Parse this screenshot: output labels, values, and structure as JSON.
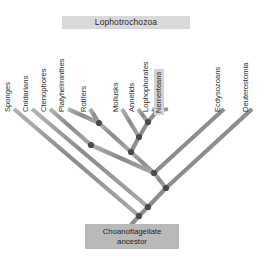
{
  "figure": {
    "title_banner": {
      "label": "Lophotrochozoa",
      "background": "#d9d9d9"
    },
    "root": {
      "line1": "Choanoflagellate",
      "line2": "ancestor",
      "background": "#b9b9b9"
    },
    "colors": {
      "branch": "#8f8f8f",
      "branch_shadow": "#c8c8c8",
      "node": "#4a4a4a",
      "text": "#2d2d2d",
      "background": "#ffffff",
      "highlight_box": "#d4d4d4"
    },
    "tips": [
      {
        "label": "Sponges",
        "highlighted": false,
        "x": 14,
        "label_y": 104
      },
      {
        "label": "Cnidarians",
        "highlighted": false,
        "x": 32,
        "label_y": 104
      },
      {
        "label": "Ctenophores",
        "highlighted": false,
        "x": 50,
        "label_y": 104
      },
      {
        "label": "Platyhelminthes",
        "highlighted": false,
        "x": 68,
        "label_y": 104
      },
      {
        "label": "Rotifers",
        "highlighted": false,
        "x": 90,
        "label_y": 104
      },
      {
        "label": "Mollusks",
        "highlighted": false,
        "x": 122,
        "label_y": 104
      },
      {
        "label": "Annelids",
        "highlighted": false,
        "x": 138,
        "label_y": 104
      },
      {
        "label": "Lophophorates",
        "highlighted": false,
        "x": 152,
        "label_y": 104
      },
      {
        "label": "Nemerteans",
        "highlighted": true,
        "x": 168,
        "label_y": 104
      },
      {
        "label": "Ecdysozoans",
        "highlighted": false,
        "x": 224,
        "label_y": 104
      },
      {
        "label": "Deuterostomia",
        "highlighted": false,
        "x": 252,
        "label_y": 104
      }
    ],
    "internal_nodes": [
      {
        "name": "platyhelminthes-rotifers",
        "x": 99,
        "y": 123
      },
      {
        "name": "lophophorates-nemerteans",
        "x": 157,
        "y": 111
      },
      {
        "name": "annelids-clade",
        "x": 148,
        "y": 122
      },
      {
        "name": "mollusks-clade",
        "x": 139,
        "y": 137
      },
      {
        "name": "lophotrochozoa-crown",
        "x": 131,
        "y": 152
      },
      {
        "name": "lophotrochozoa-base",
        "x": 91,
        "y": 145
      },
      {
        "name": "protostome-node",
        "x": 154,
        "y": 173
      },
      {
        "name": "bilateria-node",
        "x": 166,
        "y": 188
      },
      {
        "name": "eumetazoa-node",
        "x": 148,
        "y": 207
      },
      {
        "name": "metazoa-node",
        "x": 139,
        "y": 216
      }
    ]
  }
}
